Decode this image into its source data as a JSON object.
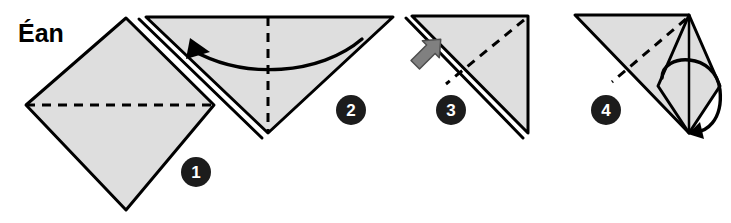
{
  "title": {
    "text": "Éan",
    "x": 18,
    "y": 42
  },
  "canvas": {
    "width": 731,
    "height": 223,
    "background": "#ffffff"
  },
  "style": {
    "paper_fill": "#dedede",
    "outline_color": "#000000",
    "outline_width": 3,
    "fold_line_color": "#000000",
    "fold_dash": "9,7",
    "arrow_color": "#000000",
    "push_arrow_fill": "#808080",
    "push_arrow_stroke": "#4d4d4d",
    "badge_fill": "#1c1c1c",
    "badge_text_color": "#ffffff"
  },
  "steps": [
    {
      "number": "1",
      "name": "square-diamond",
      "description": "Square sheet rotated 45 degrees with a horizontal valley fold line across the middle.",
      "badge": {
        "cx": 196,
        "cy": 172,
        "r": 15
      },
      "shape_points": "126,18 214,105 126,210 26,105",
      "fold_lines": [
        {
          "kind": "valley-dashed",
          "x1": 26,
          "y1": 105,
          "x2": 214,
          "y2": 105
        }
      ],
      "layer_edges": [],
      "arrows": [],
      "push_arrows": []
    },
    {
      "number": "2",
      "name": "folded-triangle-down",
      "description": "Triangle pointing down with doubled left layer edge, a curved arrow sweeping left, and a vertical dashed fold line.",
      "badge": {
        "cx": 351,
        "cy": 110,
        "r": 15
      },
      "shape_points": "146,17 393,17 268,133",
      "fold_lines": [
        {
          "kind": "valley-dashed",
          "x1": 268,
          "y1": 17,
          "x2": 268,
          "y2": 133
        }
      ],
      "layer_edges": [
        {
          "x1": 139,
          "y1": 19,
          "x2": 262,
          "y2": 138
        }
      ],
      "arrows": [
        {
          "kind": "curved-fold-arrow",
          "path": "M 362,39 C 320,75 245,80 192,50",
          "head": "190,38 210,52 186,59"
        }
      ],
      "push_arrows": []
    },
    {
      "number": "3",
      "name": "right-triangle-layers",
      "description": "Right triangle with doubled hypotenuse, a gray push arrow at the left edge, and a diagonal dashed fold line.",
      "badge": {
        "cx": 451,
        "cy": 110,
        "r": 15
      },
      "shape_points": "412,16 528,16 528,133",
      "fold_lines": [
        {
          "kind": "valley-dashed",
          "x1": 524,
          "y1": 20,
          "x2": 446,
          "y2": 84
        }
      ],
      "layer_edges": [
        {
          "x1": 406,
          "y1": 18,
          "x2": 523,
          "y2": 138
        }
      ],
      "arrows": [],
      "push_arrows": [
        {
          "kind": "push-open-arrow",
          "points": "410,46 432,46 432,40 446,52 432,64 432,58 410,58",
          "rotate": -45,
          "origin_x": 428,
          "origin_y": 52
        }
      ]
    },
    {
      "number": "4",
      "name": "kite-flap-open",
      "description": "Triangle with an opened kite flap on the right, a vertical centre line, a dashed fold line and a circular sweeping arrow ending at the bottom point.",
      "badge": {
        "cx": 606,
        "cy": 110,
        "r": 15
      },
      "shape_points": "575,15 689,15 689,133",
      "kite_points": "689,15 720,86 689,133 658,86",
      "centre_line": {
        "x1": 689,
        "y1": 15,
        "x2": 689,
        "y2": 133
      },
      "fold_lines": [
        {
          "kind": "valley-dashed",
          "x1": 686,
          "y1": 19,
          "x2": 612,
          "y2": 82
        }
      ],
      "layer_edges": [],
      "arrows": [
        {
          "kind": "circular-sweep-arrow",
          "path": "M 662,78 C 662,52 716,52 720,90 C 723,120 706,134 692,131",
          "head": "700,122 688,134 704,139"
        }
      ],
      "push_arrows": []
    }
  ]
}
